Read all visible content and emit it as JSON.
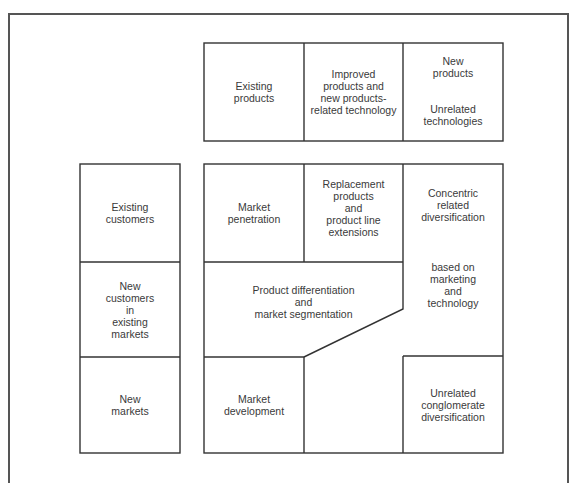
{
  "diagram": {
    "type": "product-market growth matrix",
    "column_headers": [
      {
        "id": "existing-products",
        "lines": [
          "Existing",
          "products"
        ]
      },
      {
        "id": "improved-products",
        "lines": [
          "Improved",
          "products and",
          "new products-",
          "related technology"
        ]
      },
      {
        "id": "new-products",
        "top_lines": [
          "New",
          "products"
        ],
        "bottom_lines": [
          "Unrelated",
          "technologies"
        ]
      }
    ],
    "row_headers": [
      {
        "id": "existing-customers",
        "lines": [
          "Existing",
          "customers"
        ]
      },
      {
        "id": "new-customers",
        "lines": [
          "New",
          "customers",
          "in",
          "existing",
          "markets"
        ]
      },
      {
        "id": "new-markets",
        "lines": [
          "New",
          "markets"
        ]
      }
    ],
    "cells": [
      {
        "id": "market-penetration",
        "lines": [
          "Market",
          "penetration"
        ]
      },
      {
        "id": "replacement-products",
        "lines": [
          "Replacement",
          "products",
          "and",
          "product line",
          "extensions"
        ]
      },
      {
        "id": "concentric-diversification",
        "lines": [
          "Concentric",
          "related",
          "diversification"
        ]
      },
      {
        "id": "concentric-basis",
        "lines": [
          "based on",
          "marketing",
          "and",
          "technology"
        ]
      },
      {
        "id": "product-differentiation",
        "lines": [
          "Product differentiation",
          "and",
          "market segmentation"
        ]
      },
      {
        "id": "market-development",
        "lines": [
          "Market",
          "development"
        ]
      },
      {
        "id": "unrelated-diversification",
        "lines": [
          "Unrelated",
          "conglomerate",
          "diversification"
        ]
      }
    ],
    "colors": {
      "line": "#333333",
      "text": "#3a3a3a",
      "background": "#ffffff"
    }
  }
}
